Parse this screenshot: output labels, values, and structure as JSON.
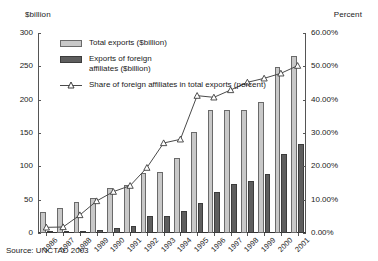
{
  "axis_titles": {
    "left": "$billion",
    "right": "Percent"
  },
  "legend": {
    "total_label": "Total exports ($billion)",
    "affiliates_label": "Exports of foreign\naffiliates ($billion)",
    "share_label": "Share of foreign affiliates in total exports (percent)"
  },
  "source": "Source: UNCTAD 2003",
  "colors": {
    "total_bar": "#c8c8c8",
    "total_bar_border": "#6a6a6a",
    "affiliates_bar": "#5e5e5e",
    "affiliates_bar_border": "#3c3c3c",
    "line": "#4a4a4a",
    "axis": "#555555"
  },
  "chart_data": {
    "type": "bar",
    "title": "",
    "subtitle": "",
    "xlabel": "",
    "ylabel": "$billion",
    "y2label": "Percent",
    "grid": false,
    "legend_position": "inside-top-left",
    "categories": [
      "1986",
      "1987",
      "1988",
      "1989",
      "1990",
      "1991",
      "1992",
      "1993",
      "1994",
      "1995",
      "1996",
      "1997",
      "1998",
      "1999",
      "2000",
      "2001"
    ],
    "ylim": [
      0,
      300
    ],
    "yticks": [
      0,
      50,
      100,
      150,
      200,
      250,
      300
    ],
    "ytick_labels": [
      "0",
      "50",
      "100",
      "150",
      "200",
      "250",
      "300"
    ],
    "y2lim": [
      0,
      60
    ],
    "y2ticks": [
      0,
      10,
      20,
      30,
      40,
      50,
      60
    ],
    "y2tick_labels": [
      "0.00%",
      "10.00%",
      "20.00%",
      "30.00%",
      "40.00%",
      "50.00%",
      "60.00%"
    ],
    "series": [
      {
        "name": "Total exports ($billion)",
        "axis": "left",
        "kind": "bar",
        "values": [
          31,
          38,
          46,
          52,
          68,
          72,
          90,
          91,
          112,
          152,
          184,
          184,
          185,
          196,
          249,
          266
        ]
      },
      {
        "name": "Exports of foreign affiliates ($billion)",
        "axis": "left",
        "kind": "bar",
        "values": [
          1.5,
          2,
          2.5,
          5,
          8,
          11,
          25,
          25,
          33,
          45,
          61,
          73,
          78,
          88,
          119,
          133
        ]
      },
      {
        "name": "Share of foreign affiliates in total exports (percent)",
        "axis": "right",
        "kind": "line",
        "marker": "triangle",
        "values": [
          1.7,
          1.8,
          5.4,
          9.6,
          12.4,
          14.2,
          19.6,
          27.0,
          28.1,
          41.2,
          40.7,
          42.9,
          45.2,
          46.4,
          47.9,
          50.2
        ]
      }
    ]
  }
}
